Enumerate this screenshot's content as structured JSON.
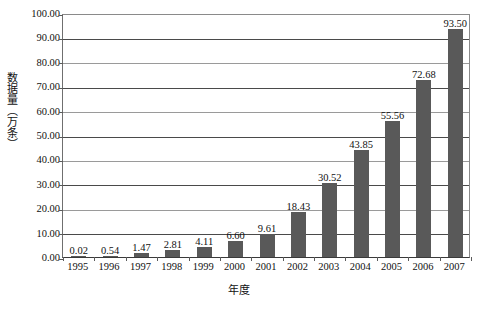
{
  "chart_data": {
    "type": "bar",
    "title": "",
    "xlabel": "年度",
    "ylabel": "数据量（万条）",
    "categories": [
      "1995",
      "1996",
      "1997",
      "1998",
      "1999",
      "2000",
      "2001",
      "2002",
      "2003",
      "2004",
      "2005",
      "2006",
      "2007"
    ],
    "values": [
      0.02,
      0.54,
      1.47,
      2.81,
      4.11,
      6.6,
      9.61,
      18.43,
      30.52,
      43.85,
      55.56,
      72.68,
      93.5
    ],
    "value_labels": [
      "0.02",
      "0.54",
      "1.47",
      "2.81",
      "4.11",
      "6.60",
      "9.61",
      "18.43",
      "30.52",
      "43.85",
      "55.56",
      "72.68",
      "93.50"
    ],
    "ylim": [
      0,
      100
    ],
    "ytick_step": 10,
    "ytick_labels": [
      "100.00",
      "90.00",
      "80.00",
      "70.00",
      "60.00",
      "50.00",
      "40.00",
      "30.00",
      "20.00",
      "10.00",
      "0.00"
    ],
    "ytick_values": [
      100,
      90,
      80,
      70,
      60,
      50,
      40,
      30,
      20,
      10,
      0
    ],
    "grid": true,
    "legend": "none",
    "bar_color": "#595959",
    "gridline_color": "#9a9a9a",
    "axis_color": "#3a3a3a"
  },
  "axes": {
    "y_title": "数据量（万条）",
    "x_title": "年度"
  },
  "caption": ""
}
